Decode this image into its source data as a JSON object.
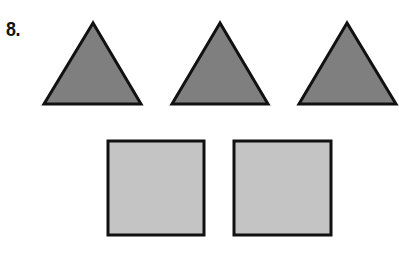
{
  "problem": {
    "number_label": "8."
  },
  "colors": {
    "triangle_fill": "#7f7f7f",
    "square_fill": "#c4c4c4",
    "stroke": "#111111",
    "background": "#ffffff"
  },
  "shapes": {
    "triangles": [
      {
        "apex": [
          93,
          23
        ],
        "base_left": [
          44,
          104
        ],
        "base_right": [
          141,
          104
        ]
      },
      {
        "apex": [
          220,
          23
        ],
        "base_left": [
          172,
          104
        ],
        "base_right": [
          268,
          104
        ]
      },
      {
        "apex": [
          347,
          23
        ],
        "base_left": [
          299,
          104
        ],
        "base_right": [
          396,
          104
        ]
      }
    ],
    "squares": [
      {
        "x": 108,
        "y": 141,
        "width": 96,
        "height": 94
      },
      {
        "x": 234,
        "y": 141,
        "width": 97,
        "height": 94
      }
    ],
    "counts": {
      "triangles": 3,
      "squares": 2
    }
  }
}
